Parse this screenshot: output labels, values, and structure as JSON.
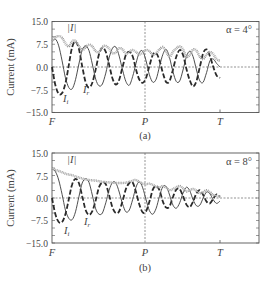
{
  "chart_data": [
    {
      "type": "line",
      "panel_label": "(a)",
      "annotation": "α = 4°",
      "ylabel": "Current (mA)",
      "xlabel": "",
      "xticks": [
        "F",
        "P",
        "T"
      ],
      "yticks": [
        "15.0",
        "7.5",
        "0.0",
        "−7.5",
        "−15.0"
      ],
      "ylim": [
        -15,
        15
      ],
      "grid": false,
      "reference_lines": [
        "horizontal dashed at 0.0",
        "vertical dashed at P"
      ],
      "x": [
        0,
        0.04,
        0.08,
        0.12,
        0.16,
        0.2,
        0.24,
        0.28,
        0.32,
        0.36,
        0.4,
        0.44,
        0.48,
        0.52,
        0.56,
        0.6,
        0.64,
        0.68,
        0.72,
        0.76,
        0.8,
        0.84,
        0.88,
        0.92,
        0.96,
        1.0,
        1.04,
        1.08,
        1.12,
        1.16,
        1.2,
        1.24,
        1.28,
        1.32,
        1.36,
        1.4,
        1.44,
        1.48,
        1.52,
        1.56,
        1.6,
        1.64,
        1.68,
        1.72,
        1.76,
        1.8,
        1.84,
        1.88,
        1.92,
        1.96,
        2.0
      ],
      "x_note": "x in units where F=0, P=1, T=2 (span F→T)",
      "series": [
        {
          "name": "|I|",
          "label": "|I|",
          "style": "thick grey dotted",
          "values": [
            8.5,
            9.8,
            10.2,
            9.6,
            7.8,
            6.8,
            8.5,
            8.6,
            7.0,
            5.6,
            6.5,
            7.4,
            6.8,
            5.2,
            5.0,
            6.6,
            7.0,
            6.0,
            4.6,
            4.8,
            6.2,
            5.8,
            4.4,
            5.0,
            5.6,
            5.0,
            4.2,
            4.8,
            5.6,
            5.2,
            4.0,
            4.6,
            5.8,
            6.6,
            5.0,
            3.4,
            5.0,
            6.2,
            6.8,
            5.8,
            3.4,
            4.0,
            5.8,
            5.4,
            3.4,
            2.6,
            4.2,
            5.0,
            4.2,
            2.6,
            2.0
          ]
        },
        {
          "name": "I_r",
          "label": "I_r",
          "style": "thin solid",
          "values": [
            8.5,
            9.2,
            7.0,
            2.0,
            -3.5,
            -6.8,
            -7.2,
            -4.2,
            1.0,
            5.6,
            7.0,
            5.4,
            1.0,
            -4.0,
            -6.2,
            -5.6,
            -2.0,
            3.0,
            6.2,
            6.6,
            3.6,
            -1.0,
            -4.8,
            -6.0,
            -3.2,
            1.2,
            4.8,
            5.2,
            2.0,
            -2.6,
            -5.0,
            -4.0,
            0.2,
            4.2,
            5.8,
            3.0,
            -1.6,
            -4.8,
            -4.6,
            -1.0,
            3.4,
            5.2,
            3.4,
            -1.0,
            -4.6,
            -5.0,
            -1.8,
            2.0,
            2.6,
            1.2,
            0.0
          ]
        },
        {
          "name": "I_i",
          "label": "I_i",
          "style": "thick dashed",
          "values": [
            0.0,
            -6.0,
            -8.8,
            -8.6,
            -5.4,
            0.6,
            6.6,
            8.4,
            6.0,
            0.2,
            -5.0,
            -6.8,
            -5.2,
            -0.8,
            4.2,
            6.4,
            5.0,
            0.8,
            -3.8,
            -5.8,
            -4.2,
            0.0,
            4.0,
            5.0,
            3.6,
            -0.8,
            -4.2,
            -5.2,
            -3.6,
            0.4,
            4.0,
            4.6,
            2.2,
            -2.0,
            -5.0,
            -4.6,
            -0.8,
            3.4,
            5.6,
            4.0,
            -0.6,
            -4.4,
            -6.4,
            -4.6,
            0.0,
            4.6,
            5.8,
            3.6,
            0.0,
            -2.8,
            -3.6
          ]
        }
      ]
    },
    {
      "type": "line",
      "panel_label": "(b)",
      "annotation": "α = 8°",
      "ylabel": "Current (mA)",
      "xlabel": "",
      "xticks": [
        "F",
        "P",
        "T"
      ],
      "yticks": [
        "15.0",
        "7.5",
        "0.0",
        "−7.5",
        "−15.0"
      ],
      "ylim": [
        -15,
        15
      ],
      "grid": false,
      "reference_lines": [
        "horizontal dashed at 0.0",
        "vertical dashed at P"
      ],
      "x": [
        0,
        0.04,
        0.08,
        0.12,
        0.16,
        0.2,
        0.24,
        0.28,
        0.32,
        0.36,
        0.4,
        0.44,
        0.48,
        0.52,
        0.56,
        0.6,
        0.64,
        0.68,
        0.72,
        0.76,
        0.8,
        0.84,
        0.88,
        0.92,
        0.96,
        1.0,
        1.04,
        1.08,
        1.12,
        1.16,
        1.2,
        1.24,
        1.28,
        1.32,
        1.36,
        1.4,
        1.44,
        1.48,
        1.52,
        1.56,
        1.6,
        1.64,
        1.68,
        1.72,
        1.76,
        1.8,
        1.84,
        1.88,
        1.92,
        1.96,
        2.0
      ],
      "x_note": "x in units where F=0, P=1, T=2 (span F→T)",
      "series": [
        {
          "name": "|I|",
          "label": "|I|",
          "style": "thick grey dotted",
          "values": [
            9.8,
            9.4,
            9.0,
            8.6,
            8.1,
            7.8,
            7.6,
            7.2,
            6.8,
            6.5,
            6.2,
            6.0,
            5.9,
            5.8,
            5.6,
            5.4,
            5.3,
            5.2,
            5.1,
            5.0,
            5.0,
            5.0,
            5.1,
            5.4,
            5.8,
            6.0,
            5.4,
            4.8,
            4.6,
            4.8,
            4.4,
            3.8,
            3.6,
            4.0,
            3.4,
            2.6,
            3.0,
            3.6,
            4.0,
            3.2,
            2.2,
            2.6,
            3.0,
            2.4,
            1.6,
            2.0,
            2.6,
            2.0,
            1.0,
            0.8,
            0.4
          ]
        },
        {
          "name": "I_r",
          "label": "I_r",
          "style": "thin solid",
          "values": [
            9.8,
            8.8,
            6.0,
            1.2,
            -4.0,
            -6.8,
            -7.2,
            -4.6,
            0.4,
            5.0,
            6.4,
            5.2,
            1.0,
            -3.6,
            -5.4,
            -5.0,
            -1.6,
            2.6,
            5.2,
            5.0,
            2.0,
            -2.0,
            -4.6,
            -4.0,
            -0.6,
            3.6,
            5.4,
            3.4,
            -0.6,
            -4.2,
            -5.4,
            -3.4,
            0.6,
            3.8,
            3.8,
            1.0,
            -2.4,
            -3.4,
            -1.6,
            1.6,
            3.6,
            2.4,
            -0.6,
            -2.6,
            -2.4,
            0.0,
            2.0,
            1.4,
            -0.6,
            -1.8,
            -1.0
          ]
        },
        {
          "name": "I_i",
          "label": "I_i",
          "style": "thick dashed",
          "values": [
            0.0,
            -5.4,
            -8.0,
            -8.0,
            -5.4,
            -0.4,
            4.6,
            6.4,
            5.0,
            0.6,
            -4.0,
            -5.6,
            -4.4,
            -0.8,
            3.6,
            5.2,
            4.6,
            1.0,
            -3.2,
            -5.0,
            -4.4,
            -1.0,
            3.0,
            5.0,
            5.2,
            2.0,
            -2.2,
            -4.8,
            -4.4,
            -1.2,
            2.8,
            4.0,
            2.6,
            -1.2,
            -3.2,
            -2.8,
            0.4,
            2.8,
            3.0,
            0.6,
            -2.2,
            -3.0,
            -1.2,
            1.6,
            2.6,
            1.0,
            -1.2,
            -1.8,
            -0.2,
            1.2,
            0.4
          ]
        }
      ]
    }
  ],
  "panels": [
    {
      "label": "(a)",
      "annotation": "α = 4°",
      "ylabel": "Current (mA)",
      "curve_labels": {
        "abs": "|I|",
        "real": "I",
        "real_sub": "r",
        "imag": "I",
        "imag_sub": "i"
      }
    },
    {
      "label": "(b)",
      "annotation": "α = 8°",
      "ylabel": "Current (mA)",
      "curve_labels": {
        "abs": "|I|",
        "real": "I",
        "real_sub": "r",
        "imag": "I",
        "imag_sub": "i"
      }
    }
  ],
  "axes": {
    "yticks": [
      "15.0",
      "7.5",
      "0.0",
      "−7.5",
      "−15.0"
    ],
    "xticks": [
      "F",
      "P",
      "T"
    ]
  }
}
